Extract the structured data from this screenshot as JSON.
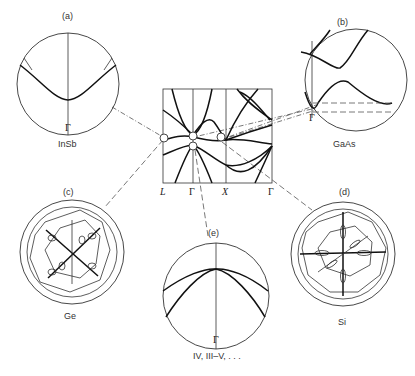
{
  "figure": {
    "center_panel": {
      "x_labels": [
        "L",
        "Γ",
        "X",
        "Γ"
      ],
      "description": "Band structure along L–Γ–X–Γ with circled extremum regions"
    },
    "panels": [
      {
        "id": "a",
        "label": "(a)",
        "material": "InSb",
        "gamma_label": "Γ"
      },
      {
        "id": "b",
        "label": "(b)",
        "material": "GaAs",
        "gamma_label": "Γ"
      },
      {
        "id": "c",
        "label": "(c)",
        "material": "Ge"
      },
      {
        "id": "d",
        "label": "(d)",
        "material": "Si"
      },
      {
        "id": "e",
        "label": "(e)",
        "material": "IV, III–V, . . .",
        "gamma_label": "Γ"
      }
    ]
  },
  "colors": {
    "line": "#111111",
    "circle": "#333333",
    "dash": "#555555",
    "background": "#ffffff"
  }
}
